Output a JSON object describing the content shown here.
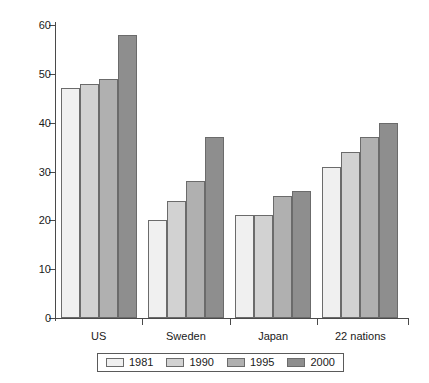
{
  "chart_data": {
    "type": "bar",
    "title": "",
    "subtitle": "",
    "xlabel": "",
    "ylabel": "",
    "ylim": [
      0,
      60
    ],
    "yticks": [
      0,
      10,
      20,
      30,
      40,
      50,
      60
    ],
    "ytick_labels": [
      "0",
      "10",
      "20",
      "30",
      "40",
      "50",
      "60"
    ],
    "grid": false,
    "legend_position": "bottom",
    "categories": [
      "US",
      "Sweden",
      "Japan",
      "22 nations"
    ],
    "series": [
      {
        "name": "1981",
        "color": "#f0f0f0",
        "values": [
          47,
          20,
          21,
          31
        ]
      },
      {
        "name": "1990",
        "color": "#d2d2d2",
        "values": [
          48,
          24,
          21,
          34
        ]
      },
      {
        "name": "1995",
        "color": "#b0b0b0",
        "values": [
          49,
          28,
          25,
          37
        ]
      },
      {
        "name": "2000",
        "color": "#8e8e8e",
        "values": [
          58,
          37,
          26,
          40
        ]
      }
    ],
    "axis_color": "#4a4a4a",
    "bar_border_color": "#6b6b6b"
  }
}
